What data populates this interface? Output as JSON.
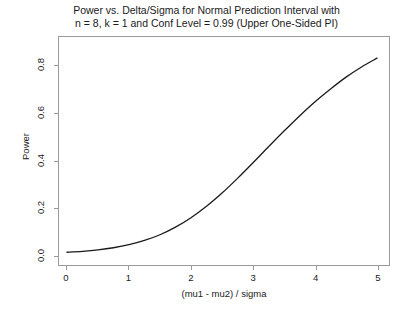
{
  "chart_data": {
    "type": "line",
    "title": "Power vs. Delta/Sigma for Normal Prediction Interval with\nn = 8, k = 1 and Conf Level = 0.99 (Upper One-Sided PI)",
    "xlabel": "(mu1 - mu2) / sigma",
    "ylabel": "Power",
    "xlim": [
      0,
      5
    ],
    "ylim": [
      0,
      0.92
    ],
    "grid": false,
    "legend": null,
    "xticks": [
      "0",
      "1",
      "2",
      "3",
      "4",
      "5"
    ],
    "xtick_values": [
      0,
      1,
      2,
      3,
      4,
      5
    ],
    "yticks": [
      "0.0",
      "0.2",
      "0.4",
      "0.6",
      "0.8"
    ],
    "ytick_values": [
      0.0,
      0.2,
      0.4,
      0.6,
      0.8
    ],
    "line_color": "#1a1a1a",
    "line_width": 1.3,
    "x": [
      0,
      0.25,
      0.5,
      0.75,
      1.0,
      1.25,
      1.5,
      1.75,
      2.0,
      2.25,
      2.5,
      2.75,
      3.0,
      3.25,
      3.5,
      3.75,
      4.0,
      4.25,
      4.5,
      4.75,
      5.0
    ],
    "y": [
      0.012,
      0.016,
      0.022,
      0.031,
      0.044,
      0.062,
      0.086,
      0.118,
      0.158,
      0.206,
      0.262,
      0.324,
      0.39,
      0.458,
      0.524,
      0.588,
      0.648,
      0.702,
      0.752,
      0.795,
      0.832
    ],
    "series": [
      {
        "name": "Power",
        "x": [
          0,
          0.25,
          0.5,
          0.75,
          1.0,
          1.25,
          1.5,
          1.75,
          2.0,
          2.25,
          2.5,
          2.75,
          3.0,
          3.25,
          3.5,
          3.75,
          4.0,
          4.25,
          4.5,
          4.75,
          5.0
        ],
        "values": [
          0.012,
          0.016,
          0.022,
          0.031,
          0.044,
          0.062,
          0.086,
          0.118,
          0.158,
          0.206,
          0.262,
          0.324,
          0.39,
          0.458,
          0.524,
          0.588,
          0.648,
          0.702,
          0.752,
          0.795,
          0.832
        ]
      }
    ]
  }
}
